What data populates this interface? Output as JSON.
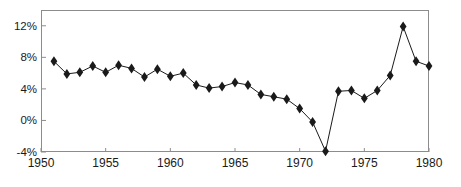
{
  "chart_data": {
    "type": "line",
    "title": "",
    "subtitle": "",
    "xlabel": "",
    "ylabel": "",
    "xlim": [
      1950,
      1980
    ],
    "ylim": [
      -4,
      14
    ],
    "grid": false,
    "legend": null,
    "marker": "diamond",
    "line_color": "#1a1a1a",
    "marker_color": "#1a1a1a",
    "frame_color": "#8c8c8c",
    "background": "#ffffff",
    "x_ticks": [
      1950,
      1955,
      1960,
      1965,
      1970,
      1975,
      1980
    ],
    "x_tick_labels": [
      "1950",
      "1955",
      "1960",
      "1965",
      "1970",
      "1975",
      "1980"
    ],
    "y_ticks": [
      -4,
      0,
      4,
      8,
      12
    ],
    "y_tick_labels": [
      "-4%",
      "0%",
      "4%",
      "8%",
      "12%"
    ],
    "x": [
      1951,
      1952,
      1953,
      1954,
      1955,
      1956,
      1957,
      1958,
      1959,
      1960,
      1961,
      1962,
      1963,
      1964,
      1965,
      1966,
      1967,
      1968,
      1969,
      1970,
      1971,
      1972,
      1973,
      1974,
      1975,
      1976,
      1977,
      1978,
      1979,
      1980
    ],
    "values": [
      7.5,
      5.9,
      6.1,
      6.9,
      6.1,
      7.0,
      6.6,
      5.5,
      6.5,
      5.6,
      6.0,
      4.5,
      4.1,
      4.3,
      4.8,
      4.5,
      3.3,
      3.0,
      2.7,
      1.5,
      -0.2,
      -3.9,
      3.7,
      3.8,
      2.8,
      3.8,
      5.7,
      11.9,
      7.5,
      6.9
    ],
    "series": [
      {
        "name": "series-1",
        "values": [
          7.5,
          5.9,
          6.1,
          6.9,
          6.1,
          7.0,
          6.6,
          5.5,
          6.5,
          5.6,
          6.0,
          4.5,
          4.1,
          4.3,
          4.8,
          4.5,
          3.3,
          3.0,
          2.7,
          1.5,
          -0.2,
          -3.9,
          3.7,
          3.8,
          2.8,
          3.8,
          5.7,
          11.9,
          7.5,
          6.9
        ]
      }
    ]
  }
}
